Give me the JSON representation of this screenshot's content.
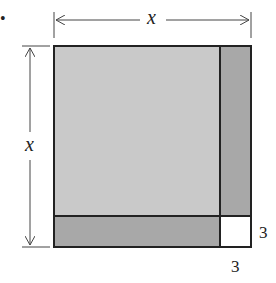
{
  "bullet": "•",
  "labels": {
    "top_dimension": "x",
    "left_dimension": "x",
    "right_small": "3",
    "bottom_small": "3"
  },
  "colors": {
    "big_square": "#c8c8c8",
    "strips": "#a9a9a9",
    "small_square": "#ffffff",
    "stroke": "#222222"
  }
}
